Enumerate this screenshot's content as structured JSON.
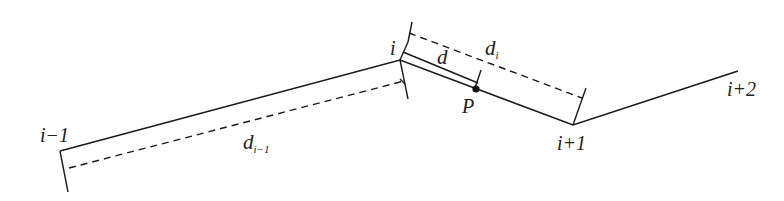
{
  "diagram": {
    "type": "polyline-segment-distance",
    "colors": {
      "line": "#1a1a1a",
      "background": "#ffffff"
    },
    "vertices": [
      {
        "id": "i-1",
        "label": "i−1",
        "x": 60,
        "y": 151
      },
      {
        "id": "i",
        "label": "i",
        "x": 400,
        "y": 60
      },
      {
        "id": "i+1",
        "label": "i+1",
        "x": 573,
        "y": 125
      },
      {
        "id": "i+2",
        "label": "i+2",
        "x": 738,
        "y": 71
      }
    ],
    "point": {
      "label": "P",
      "x": 476,
      "y": 89
    },
    "dimensions": [
      {
        "label_main": "d",
        "label_sub": "i−1",
        "desc": "length of segment i-1 to i"
      },
      {
        "label_main": "d",
        "label_sub": "i",
        "desc": "length of segment i to i+1"
      },
      {
        "label_main": "d",
        "label_sub": "",
        "desc": "distance from vertex i to P"
      }
    ]
  }
}
